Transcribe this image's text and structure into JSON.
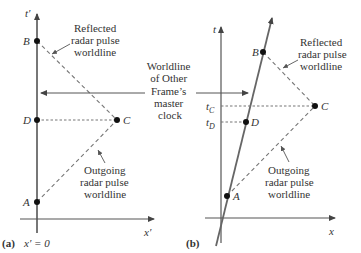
{
  "panel_a": {
    "tag": "(a)",
    "axis_vertical_label": "t′",
    "axis_horizontal_label": "x′",
    "position_label": "x′ = 0",
    "points": {
      "A": "A",
      "B": "B",
      "C": "C",
      "D": "D"
    },
    "reflected_label": [
      "Reflected",
      "radar pulse",
      "worldline"
    ],
    "outgoing_label": [
      "Outgoing",
      "radar pulse",
      "worldline"
    ]
  },
  "center_label": [
    "Worldline",
    "of Other",
    "Frame’s",
    "master",
    "clock"
  ],
  "panel_b": {
    "tag": "(b)",
    "axis_vertical_label": "t",
    "axis_horizontal_label": "x",
    "points": {
      "A": "A",
      "B": "B",
      "C": "C",
      "D": "D"
    },
    "tick_tc": "t",
    "tick_tc_sub": "C",
    "tick_td": "t",
    "tick_td_sub": "D",
    "reflected_label": [
      "Reflected",
      "radar pulse",
      "worldline"
    ],
    "outgoing_label": [
      "Outgoing",
      "radar pulse",
      "worldline"
    ]
  },
  "colors": {
    "axis": "#555555",
    "line": "#666666",
    "dashed": "#777777",
    "dot": "#111111",
    "text": "#333333"
  }
}
